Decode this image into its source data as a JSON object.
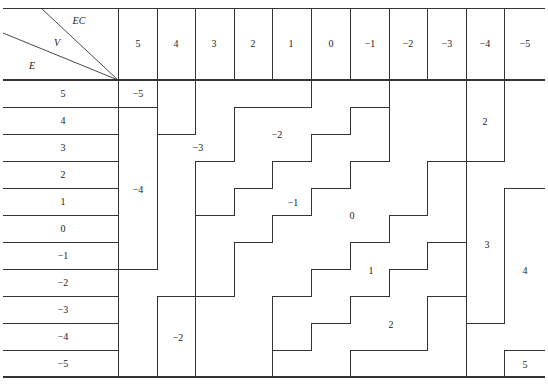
{
  "table": {
    "corner_labels": {
      "ec": "EC",
      "v": "V",
      "e": "E"
    },
    "columns_ec": [
      "5",
      "4",
      "3",
      "2",
      "1",
      "0",
      "−1",
      "−2",
      "−3",
      "−4",
      "−5"
    ],
    "rows_e": [
      "5",
      "4",
      "3",
      "2",
      "1",
      "0",
      "−1",
      "−2",
      "−3",
      "−4",
      "−5"
    ],
    "regions": [
      {
        "value": "−5",
        "x": 138,
        "y": 94
      },
      {
        "value": "−4",
        "x": 138,
        "y": 190
      },
      {
        "value": "−3",
        "x": 198,
        "y": 148
      },
      {
        "value": "−2",
        "x": 277,
        "y": 135
      },
      {
        "value": "−1",
        "x": 293,
        "y": 203
      },
      {
        "value": "0",
        "x": 352,
        "y": 216
      },
      {
        "value": "1",
        "x": 371,
        "y": 271
      },
      {
        "value": "2",
        "x": 485,
        "y": 122
      },
      {
        "value": "2",
        "x": 391,
        "y": 325
      },
      {
        "value": "3",
        "x": 487,
        "y": 245
      },
      {
        "value": "4",
        "x": 525,
        "y": 271
      },
      {
        "value": "5",
        "x": 525,
        "y": 365
      },
      {
        "value": "−2",
        "x": 178,
        "y": 338
      }
    ],
    "line_color": "#333333"
  }
}
